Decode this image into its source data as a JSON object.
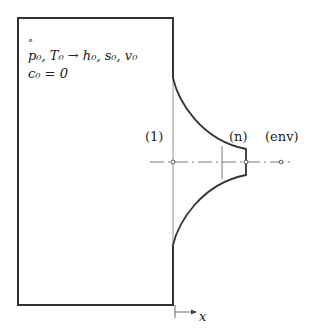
{
  "diagram": {
    "type": "nozzle-outflow-from-tank",
    "tank": {
      "state_marker": "°",
      "line1": "p₀, T₀ → h₀, s₀, v₀",
      "line2": "c₀ = 0"
    },
    "sections": {
      "inlet": "(1)",
      "exit": "(n)",
      "environment": "(env)"
    },
    "axis": {
      "label": "x"
    },
    "colors": {
      "stroke": "#333333",
      "thin": "#555555",
      "background": "#ffffff"
    }
  }
}
